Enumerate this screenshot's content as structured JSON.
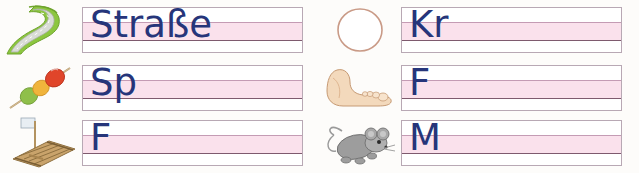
{
  "worksheet": {
    "title": "Schreiblinien-Arbeitsblatt",
    "letter_color": "#26357a",
    "band_color": "#f8d7e6",
    "baseline_color": "#7e5a6e",
    "box_border_color": "#b8a8b4",
    "page_background": "#fdfcfa"
  },
  "rows": [
    {
      "left": {
        "picture_name": "strasse-picture",
        "picture_label": "Straße",
        "written_text": "Straße"
      },
      "right": {
        "picture_name": "kreis-picture",
        "picture_label": "Kreis",
        "written_text": "Kr"
      }
    },
    {
      "left": {
        "picture_name": "spiess-picture",
        "picture_label": "Spieß",
        "written_text": "Sp"
      },
      "right": {
        "picture_name": "fuss-picture",
        "picture_label": "Fuß",
        "written_text": "F"
      }
    },
    {
      "left": {
        "picture_name": "floss-picture",
        "picture_label": "Floß",
        "written_text": "F"
      },
      "right": {
        "picture_name": "maus-picture",
        "picture_label": "Maus",
        "written_text": "M"
      }
    }
  ]
}
